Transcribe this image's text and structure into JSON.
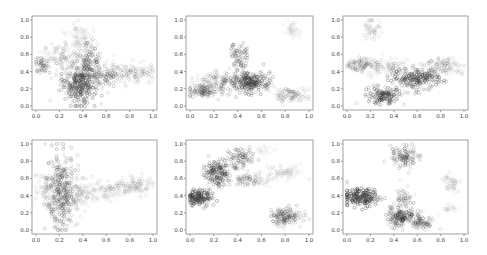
{
  "figure": {
    "width": 487,
    "height": 255,
    "background": "#ffffff",
    "point_color": "#2e2e2e",
    "frame_color": "#8a8a8a"
  },
  "chart_data": [
    {
      "type": "scatter",
      "title": "",
      "xlabel": "",
      "ylabel": "",
      "xlim": [
        0.0,
        1.0
      ],
      "ylim": [
        0.0,
        1.0
      ],
      "xticks": [
        "0.0",
        "0.2",
        "0.4",
        "0.6",
        "0.8",
        "1.0"
      ],
      "yticks": [
        "0.0",
        "0.2",
        "0.4",
        "0.6",
        "0.8",
        "1.0"
      ],
      "grid": false,
      "legend": null,
      "box": {
        "x": 32,
        "y": 16,
        "w": 125,
        "h": 94
      },
      "clusters": [
        {
          "cx": 0.36,
          "cy": 0.25,
          "sx": 0.07,
          "sy": 0.12,
          "n": 260,
          "alpha": 0.45
        },
        {
          "cx": 0.45,
          "cy": 0.42,
          "sx": 0.06,
          "sy": 0.15,
          "n": 160,
          "alpha": 0.35
        },
        {
          "cx": 0.2,
          "cy": 0.55,
          "sx": 0.12,
          "sy": 0.1,
          "n": 120,
          "alpha": 0.18
        },
        {
          "cx": 0.38,
          "cy": 0.75,
          "sx": 0.07,
          "sy": 0.12,
          "n": 90,
          "alpha": 0.15
        },
        {
          "cx": 0.05,
          "cy": 0.48,
          "sx": 0.03,
          "sy": 0.05,
          "n": 40,
          "alpha": 0.35
        },
        {
          "cx": 0.62,
          "cy": 0.35,
          "sx": 0.05,
          "sy": 0.06,
          "n": 60,
          "alpha": 0.3
        },
        {
          "cx": 0.82,
          "cy": 0.38,
          "sx": 0.1,
          "sy": 0.06,
          "n": 130,
          "alpha": 0.18
        }
      ]
    },
    {
      "type": "scatter",
      "title": "",
      "xlabel": "",
      "ylabel": "",
      "xlim": [
        0.0,
        1.0
      ],
      "ylim": [
        0.0,
        1.0
      ],
      "xticks": [
        "0.0",
        "0.2",
        "0.4",
        "0.6",
        "0.8",
        "1.0"
      ],
      "yticks": [
        "0.0",
        "0.2",
        "0.4",
        "0.6",
        "0.8",
        "1.0"
      ],
      "grid": false,
      "legend": null,
      "box": {
        "x": 186,
        "y": 16,
        "w": 127,
        "h": 94
      },
      "clusters": [
        {
          "cx": 0.5,
          "cy": 0.28,
          "sx": 0.09,
          "sy": 0.06,
          "n": 250,
          "alpha": 0.45
        },
        {
          "cx": 0.42,
          "cy": 0.58,
          "sx": 0.04,
          "sy": 0.07,
          "n": 70,
          "alpha": 0.35
        },
        {
          "cx": 0.12,
          "cy": 0.18,
          "sx": 0.07,
          "sy": 0.05,
          "n": 140,
          "alpha": 0.3
        },
        {
          "cx": 0.25,
          "cy": 0.32,
          "sx": 0.08,
          "sy": 0.04,
          "n": 70,
          "alpha": 0.18
        },
        {
          "cx": 0.85,
          "cy": 0.12,
          "sx": 0.07,
          "sy": 0.05,
          "n": 110,
          "alpha": 0.18
        },
        {
          "cx": 0.86,
          "cy": 0.88,
          "sx": 0.04,
          "sy": 0.06,
          "n": 45,
          "alpha": 0.1
        }
      ]
    },
    {
      "type": "scatter",
      "title": "",
      "xlabel": "",
      "ylabel": "",
      "xlim": [
        0.0,
        1.0
      ],
      "ylim": [
        0.0,
        1.0
      ],
      "xticks": [
        "0.0",
        "0.2",
        "0.4",
        "0.6",
        "0.8",
        "1.0"
      ],
      "yticks": [
        "0.0",
        "0.2",
        "0.4",
        "0.6",
        "0.8",
        "1.0"
      ],
      "grid": false,
      "legend": null,
      "box": {
        "x": 343,
        "y": 16,
        "w": 125,
        "h": 94
      },
      "clusters": [
        {
          "cx": 0.6,
          "cy": 0.32,
          "sx": 0.1,
          "sy": 0.06,
          "n": 220,
          "alpha": 0.45
        },
        {
          "cx": 0.32,
          "cy": 0.12,
          "sx": 0.07,
          "sy": 0.05,
          "n": 150,
          "alpha": 0.45
        },
        {
          "cx": 0.12,
          "cy": 0.48,
          "sx": 0.08,
          "sy": 0.04,
          "n": 90,
          "alpha": 0.25
        },
        {
          "cx": 0.35,
          "cy": 0.45,
          "sx": 0.1,
          "sy": 0.06,
          "n": 110,
          "alpha": 0.14
        },
        {
          "cx": 0.82,
          "cy": 0.47,
          "sx": 0.08,
          "sy": 0.05,
          "n": 110,
          "alpha": 0.18
        },
        {
          "cx": 0.22,
          "cy": 0.88,
          "sx": 0.04,
          "sy": 0.06,
          "n": 55,
          "alpha": 0.14
        }
      ]
    },
    {
      "type": "scatter",
      "title": "",
      "xlabel": "",
      "ylabel": "",
      "xlim": [
        0.0,
        1.0
      ],
      "ylim": [
        0.0,
        1.0
      ],
      "xticks": [
        "0.0",
        "0.2",
        "0.4",
        "0.6",
        "0.8",
        "1.0"
      ],
      "yticks": [
        "0.0",
        "0.2",
        "0.4",
        "0.6",
        "0.8",
        "1.0"
      ],
      "grid": false,
      "legend": null,
      "box": {
        "x": 32,
        "y": 140,
        "w": 125,
        "h": 94
      },
      "clusters": [
        {
          "cx": 0.22,
          "cy": 0.45,
          "sx": 0.06,
          "sy": 0.22,
          "n": 300,
          "alpha": 0.35
        },
        {
          "cx": 0.12,
          "cy": 0.45,
          "sx": 0.06,
          "sy": 0.12,
          "n": 90,
          "alpha": 0.18
        },
        {
          "cx": 0.35,
          "cy": 0.4,
          "sx": 0.07,
          "sy": 0.1,
          "n": 90,
          "alpha": 0.18
        },
        {
          "cx": 0.58,
          "cy": 0.45,
          "sx": 0.1,
          "sy": 0.05,
          "n": 110,
          "alpha": 0.14
        },
        {
          "cx": 0.85,
          "cy": 0.52,
          "sx": 0.08,
          "sy": 0.06,
          "n": 120,
          "alpha": 0.14
        }
      ]
    },
    {
      "type": "scatter",
      "title": "",
      "xlabel": "",
      "ylabel": "",
      "xlim": [
        0.0,
        1.0
      ],
      "ylim": [
        0.0,
        1.0
      ],
      "xticks": [
        "0.0",
        "0.2",
        "0.4",
        "0.6",
        "0.8",
        "1.0"
      ],
      "yticks": [
        "0.0",
        "0.2",
        "0.4",
        "0.6",
        "0.8",
        "1.0"
      ],
      "grid": false,
      "legend": null,
      "box": {
        "x": 186,
        "y": 140,
        "w": 127,
        "h": 94
      },
      "clusters": [
        {
          "cx": 0.08,
          "cy": 0.38,
          "sx": 0.05,
          "sy": 0.05,
          "n": 160,
          "alpha": 0.5
        },
        {
          "cx": 0.22,
          "cy": 0.65,
          "sx": 0.05,
          "sy": 0.07,
          "n": 150,
          "alpha": 0.45
        },
        {
          "cx": 0.42,
          "cy": 0.84,
          "sx": 0.06,
          "sy": 0.06,
          "n": 90,
          "alpha": 0.35
        },
        {
          "cx": 0.48,
          "cy": 0.58,
          "sx": 0.1,
          "sy": 0.04,
          "n": 100,
          "alpha": 0.22
        },
        {
          "cx": 0.8,
          "cy": 0.68,
          "sx": 0.08,
          "sy": 0.04,
          "n": 80,
          "alpha": 0.12
        },
        {
          "cx": 0.8,
          "cy": 0.16,
          "sx": 0.07,
          "sy": 0.05,
          "n": 150,
          "alpha": 0.3
        },
        {
          "cx": 0.62,
          "cy": 0.92,
          "sx": 0.04,
          "sy": 0.03,
          "n": 25,
          "alpha": 0.08
        }
      ]
    },
    {
      "type": "scatter",
      "title": "",
      "xlabel": "",
      "ylabel": "",
      "xlim": [
        0.0,
        1.0
      ],
      "ylim": [
        0.0,
        1.0
      ],
      "xticks": [
        "0.0",
        "0.2",
        "0.4",
        "0.6",
        "0.8",
        "1.0"
      ],
      "yticks": [
        "0.0",
        "0.2",
        "0.4",
        "0.6",
        "0.8",
        "1.0"
      ],
      "grid": false,
      "legend": null,
      "box": {
        "x": 343,
        "y": 140,
        "w": 125,
        "h": 94
      },
      "clusters": [
        {
          "cx": 0.12,
          "cy": 0.38,
          "sx": 0.07,
          "sy": 0.05,
          "n": 190,
          "alpha": 0.55
        },
        {
          "cx": 0.47,
          "cy": 0.15,
          "sx": 0.07,
          "sy": 0.05,
          "n": 140,
          "alpha": 0.45
        },
        {
          "cx": 0.64,
          "cy": 0.08,
          "sx": 0.05,
          "sy": 0.03,
          "n": 70,
          "alpha": 0.3
        },
        {
          "cx": 0.48,
          "cy": 0.36,
          "sx": 0.04,
          "sy": 0.06,
          "n": 60,
          "alpha": 0.25
        },
        {
          "cx": 0.49,
          "cy": 0.85,
          "sx": 0.06,
          "sy": 0.06,
          "n": 110,
          "alpha": 0.35
        },
        {
          "cx": 0.9,
          "cy": 0.55,
          "sx": 0.04,
          "sy": 0.05,
          "n": 55,
          "alpha": 0.14
        },
        {
          "cx": 0.88,
          "cy": 0.25,
          "sx": 0.04,
          "sy": 0.03,
          "n": 30,
          "alpha": 0.1
        }
      ]
    }
  ]
}
